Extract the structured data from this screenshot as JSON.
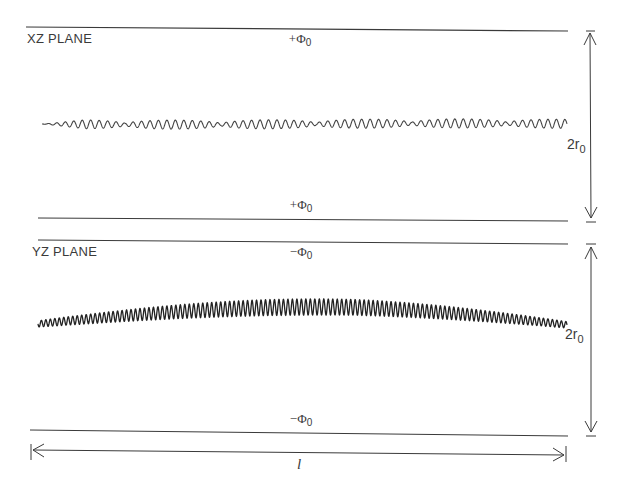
{
  "panels": [
    {
      "id": "xz",
      "label": "XZ PLANE",
      "top_potential": {
        "sign": "+",
        "symbol": "Φ",
        "sub": "0"
      },
      "bottom_potential": {
        "sign": "+",
        "symbol": "Φ",
        "sub": "0"
      },
      "aperture": {
        "main": "2r",
        "sub": "0"
      },
      "trajectory": {
        "type": "weak-oscillation-beating",
        "x_start": 42,
        "x_end": 567,
        "center_y": 124,
        "amplitude": 4.5,
        "cycles": 62
      }
    },
    {
      "id": "yz",
      "label": "YZ PLANE",
      "top_potential": {
        "sign": "−",
        "symbol": "Φ",
        "sub": "0"
      },
      "bottom_potential": {
        "sign": "−",
        "symbol": "Φ",
        "sub": "0"
      },
      "aperture": {
        "main": "2r",
        "sub": "0"
      },
      "trajectory": {
        "type": "strong-oscillation-arched",
        "x_start": 38,
        "x_end": 567,
        "cycles": 118
      }
    }
  ],
  "length_dimension": {
    "label": "l"
  },
  "colors": {
    "line": "#3a3a3a",
    "wave": "#2a2a2a",
    "background": "#ffffff"
  }
}
